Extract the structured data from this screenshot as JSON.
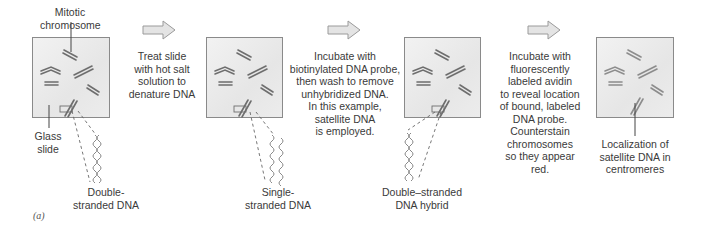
{
  "figure": {
    "panel_label": "(a)",
    "colors": {
      "slide_border": "#8a8a8a",
      "chromosome": "#6e6e6e",
      "chromosome_final": "#9a9a9a",
      "arrow_fill": "#e4e4e4",
      "arrow_stroke": "#9a9a9a"
    },
    "steps": [
      {
        "slide_labels": {
          "top": "Mitotic\nchromosome",
          "left": "Glass\nslide",
          "bottom": "Double-\nstranded DNA"
        }
      },
      {
        "arrow_text": "Treat slide\nwith hot salt\nsolution to\ndenature DNA"
      },
      {
        "slide_labels": {
          "bottom": "Single-\nstranded DNA"
        }
      },
      {
        "arrow_text": "Incubate with\nbiotinylated DNA probe,\nthen wash to remove\nunhybridized DNA.\nIn this example,\nsatellite DNA\nis employed."
      },
      {
        "slide_labels": {
          "bottom": "Double–stranded\nDNA hybrid"
        }
      },
      {
        "arrow_text": "Incubate with\nfluorescently\nlabeled avidin\nto reveal location\nof bound, labeled\nDNA probe.\nCounterstain\nchromosomes\nso they appear\nred."
      },
      {
        "slide_labels": {
          "bottom": "Localization of\nsatellite DNA in\ncentromeres"
        }
      }
    ]
  }
}
